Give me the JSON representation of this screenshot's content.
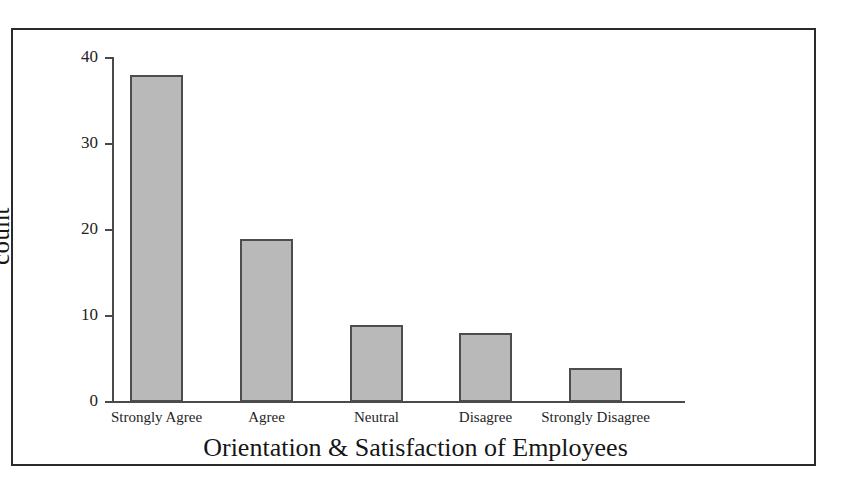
{
  "figure": {
    "clipped_header_remnant": "",
    "frame_color": "#2b2b2b",
    "background_color": "#ffffff"
  },
  "chart_data": {
    "type": "bar",
    "title": "",
    "subtitle": "",
    "xlabel": "Orientation & Satisfaction of Employees",
    "ylabel": "count",
    "categories": [
      "Strongly Agree",
      "Agree",
      "Neutral",
      "Disagree",
      "Strongly Disagree"
    ],
    "values": [
      38,
      19,
      9,
      8,
      4
    ],
    "ylim": [
      0,
      40
    ],
    "yticks": [
      0,
      10,
      20,
      30,
      40
    ],
    "ytick_labels": [
      "0",
      "10",
      "20",
      "30",
      "40"
    ],
    "grid": false,
    "legend": false,
    "legend_position": "none",
    "bar_fill_color": "#b9b9b9",
    "bar_edge_color": "#4d4d4d",
    "axis_color": "#4a4a4a"
  }
}
